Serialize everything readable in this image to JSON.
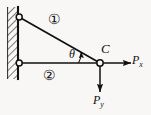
{
  "figure": {
    "type": "statics-free-body-diagram",
    "background_color": "#f8f7f5",
    "stroke_color": "#101010",
    "labels": {
      "joint_c": "C",
      "angle": "θ",
      "force_x_main": "P",
      "force_x_sub": "x",
      "force_y_main": "P",
      "force_y_sub": "y",
      "member_one": "①",
      "member_two": "②"
    },
    "geometry": {
      "wall_x": 18,
      "wall_top_y": 7,
      "wall_bottom_y": 79,
      "hatch_left_x": 7,
      "pin_top": {
        "x": 19,
        "y": 17,
        "r": 3
      },
      "pin_bottom": {
        "x": 19,
        "y": 63,
        "r": 3
      },
      "joint_c": {
        "x": 100,
        "y": 63,
        "r": 3.2
      },
      "arrow_px_tip": {
        "x": 131,
        "y": 63
      },
      "arrow_py_tip": {
        "x": 100,
        "y": 92
      },
      "angle_arc_radius": 22
    }
  }
}
